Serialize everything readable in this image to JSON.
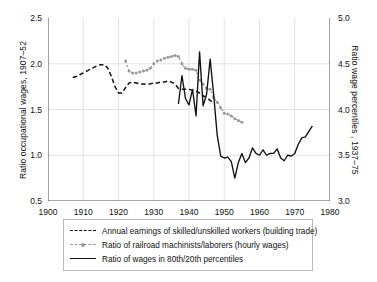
{
  "chart_data": {
    "type": "line",
    "title": "",
    "xlabel": "",
    "ylabel": "Ratio occupational wages, 1907–52",
    "ylabel_right": "Ratio wage percentiles , 1937–75",
    "xlim": [
      1900,
      1980
    ],
    "ylim": [
      0.5,
      2.5
    ],
    "ylim_right": [
      3.0,
      5.0
    ],
    "xticks": [
      1900,
      1910,
      1920,
      1930,
      1940,
      1950,
      1960,
      1970,
      1980
    ],
    "yticks_left": [
      "0.5",
      "1.0",
      "1.5",
      "2.0",
      "2.5"
    ],
    "yticks_right": [
      "3.0",
      "3.5",
      "4.0",
      "4.5",
      "5.0"
    ],
    "grid": true,
    "legend_position": "below-plot",
    "series": [
      {
        "name": "Annual earnings of skilled/unskilled workers (building trade)",
        "axis": "left",
        "style": "dashed",
        "color": "#111111",
        "points": [
          [
            1907,
            1.85
          ],
          [
            1908,
            1.86
          ],
          [
            1909,
            1.88
          ],
          [
            1910,
            1.9
          ],
          [
            1911,
            1.92
          ],
          [
            1912,
            1.94
          ],
          [
            1913,
            1.96
          ],
          [
            1914,
            1.98
          ],
          [
            1915,
            1.99
          ],
          [
            1916,
            1.99
          ],
          [
            1917,
            1.95
          ],
          [
            1918,
            1.86
          ],
          [
            1919,
            1.75
          ],
          [
            1920,
            1.68
          ],
          [
            1921,
            1.68
          ],
          [
            1922,
            1.74
          ],
          [
            1923,
            1.79
          ],
          [
            1924,
            1.8
          ],
          [
            1925,
            1.79
          ],
          [
            1926,
            1.78
          ],
          [
            1927,
            1.78
          ],
          [
            1928,
            1.78
          ],
          [
            1929,
            1.78
          ],
          [
            1930,
            1.79
          ],
          [
            1931,
            1.79
          ],
          [
            1932,
            1.8
          ],
          [
            1933,
            1.8
          ],
          [
            1934,
            1.81
          ],
          [
            1935,
            1.8
          ],
          [
            1936,
            1.78
          ],
          [
            1937,
            1.73
          ],
          [
            1938,
            1.72
          ],
          [
            1939,
            1.72
          ],
          [
            1940,
            1.72
          ],
          [
            1941,
            1.71
          ],
          [
            1942,
            1.7
          ],
          [
            1943,
            1.68
          ],
          [
            1944,
            1.65
          ],
          [
            1945,
            1.63
          ],
          [
            1946,
            1.6
          ],
          [
            1947,
            1.57
          ]
        ]
      },
      {
        "name": "Ratio of railroad machinists/laborers (hourly wages)",
        "axis": "left",
        "style": "dotted-marker",
        "color": "#9a9a9a",
        "points": [
          [
            1922,
            2.03
          ],
          [
            1923,
            1.92
          ],
          [
            1924,
            1.9
          ],
          [
            1925,
            1.9
          ],
          [
            1926,
            1.91
          ],
          [
            1927,
            1.92
          ],
          [
            1928,
            1.93
          ],
          [
            1929,
            1.95
          ],
          [
            1930,
            2.0
          ],
          [
            1931,
            2.03
          ],
          [
            1932,
            2.04
          ],
          [
            1933,
            2.06
          ],
          [
            1934,
            2.07
          ],
          [
            1935,
            2.08
          ],
          [
            1936,
            2.09
          ],
          [
            1937,
            2.08
          ],
          [
            1938,
            2.0
          ],
          [
            1939,
            1.95
          ],
          [
            1940,
            1.94
          ],
          [
            1941,
            1.94
          ],
          [
            1942,
            1.93
          ],
          [
            1943,
            1.82
          ],
          [
            1944,
            1.78
          ],
          [
            1945,
            1.73
          ],
          [
            1946,
            1.72
          ],
          [
            1947,
            1.63
          ],
          [
            1948,
            1.58
          ],
          [
            1949,
            1.52
          ],
          [
            1950,
            1.46
          ],
          [
            1951,
            1.45
          ],
          [
            1952,
            1.43
          ],
          [
            1953,
            1.4
          ],
          [
            1954,
            1.38
          ],
          [
            1955,
            1.36
          ]
        ]
      },
      {
        "name": "Ratio of wages in 80th/20th percentiles",
        "axis": "right",
        "style": "solid",
        "color": "#111111",
        "points": [
          [
            1937,
            4.06
          ],
          [
            1938,
            4.37
          ],
          [
            1939,
            4.12
          ],
          [
            1940,
            4.05
          ],
          [
            1941,
            4.22
          ],
          [
            1942,
            3.93
          ],
          [
            1943,
            4.63
          ],
          [
            1944,
            4.04
          ],
          [
            1945,
            4.17
          ],
          [
            1946,
            4.55
          ],
          [
            1947,
            4.16
          ],
          [
            1948,
            3.72
          ],
          [
            1949,
            3.49
          ],
          [
            1950,
            3.47
          ],
          [
            1951,
            3.48
          ],
          [
            1952,
            3.43
          ],
          [
            1953,
            3.25
          ],
          [
            1954,
            3.42
          ],
          [
            1955,
            3.52
          ],
          [
            1956,
            3.42
          ],
          [
            1957,
            3.47
          ],
          [
            1958,
            3.58
          ],
          [
            1959,
            3.52
          ],
          [
            1960,
            3.5
          ],
          [
            1961,
            3.56
          ],
          [
            1962,
            3.5
          ],
          [
            1963,
            3.52
          ],
          [
            1964,
            3.52
          ],
          [
            1965,
            3.57
          ],
          [
            1966,
            3.47
          ],
          [
            1967,
            3.44
          ],
          [
            1968,
            3.5
          ],
          [
            1969,
            3.49
          ],
          [
            1970,
            3.52
          ],
          [
            1971,
            3.62
          ],
          [
            1972,
            3.69
          ],
          [
            1973,
            3.7
          ],
          [
            1974,
            3.76
          ],
          [
            1975,
            3.82
          ]
        ]
      }
    ]
  },
  "legend": {
    "items": [
      {
        "key": "dashed",
        "label": "Annual earnings of skilled/unskilled workers (building trade)"
      },
      {
        "key": "dotted-marker",
        "label": "Ratio of railroad machinists/laborers (hourly wages)"
      },
      {
        "key": "solid",
        "label": "Ratio of wages in 80th/20th percentiles"
      }
    ]
  }
}
